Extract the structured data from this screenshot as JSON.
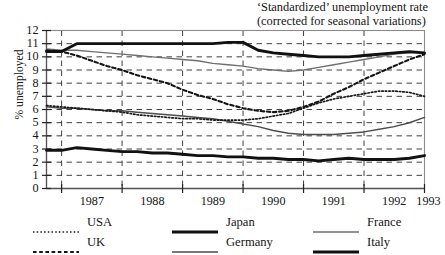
{
  "title": {
    "line1": "‘Standardized’ unemployment rate",
    "line2": "(corrected for seasonal variations)"
  },
  "axes": {
    "ylabel": "% unemployed",
    "yticks": [
      "12",
      "11",
      "10",
      "9",
      "8",
      "7",
      "6",
      "5",
      "4",
      "3",
      "2",
      "1",
      "0"
    ],
    "xticks": [
      "1987",
      "1988",
      "1989",
      "1990",
      "1991",
      "1992",
      "1993"
    ]
  },
  "legend": [
    {
      "name": "USA",
      "style": "dotted",
      "color": "#1a1a1a",
      "width": 1.6
    },
    {
      "name": "UK",
      "style": "dashed",
      "color": "#1a1a1a",
      "width": 2.1
    },
    {
      "name": "Japan",
      "style": "solid-thick",
      "color": "#111111",
      "width": 3.0
    },
    {
      "name": "Germany",
      "style": "solid-medium",
      "color": "#4d4d4d",
      "width": 1.5
    },
    {
      "name": "France",
      "style": "solid-thin",
      "color": "#6e6e6e",
      "width": 1.4
    },
    {
      "name": "Italy",
      "style": "solid-thick",
      "color": "#111111",
      "width": 2.9
    }
  ],
  "chart_data": {
    "type": "line",
    "title": "‘Standardized’ unemployment rate (corrected for seasonal variations)",
    "xlabel": "",
    "ylabel": "% unemployed",
    "xlim": [
      1986.75,
      1993.0
    ],
    "ylim": [
      0,
      12
    ],
    "grid": true,
    "legend_position": "below",
    "x": [
      1986.75,
      1987.0,
      1987.25,
      1987.5,
      1987.75,
      1988.0,
      1988.25,
      1988.5,
      1988.75,
      1989.0,
      1989.25,
      1989.5,
      1989.75,
      1990.0,
      1990.25,
      1990.5,
      1990.75,
      1991.0,
      1991.25,
      1991.5,
      1991.75,
      1992.0,
      1992.25,
      1992.5,
      1992.75,
      1993.0
    ],
    "series": [
      {
        "name": "Italy",
        "style": "solid-thick",
        "values": [
          10.4,
          10.4,
          11.0,
          11.0,
          11.0,
          11.0,
          11.0,
          11.0,
          11.0,
          11.0,
          11.0,
          11.0,
          11.1,
          11.1,
          10.5,
          10.3,
          10.2,
          10.1,
          10.0,
          10.0,
          10.0,
          10.1,
          10.2,
          10.3,
          10.4,
          10.3
        ]
      },
      {
        "name": "France",
        "style": "solid-thin",
        "values": [
          10.6,
          10.5,
          10.5,
          10.4,
          10.3,
          10.2,
          10.1,
          10.0,
          9.9,
          9.8,
          9.7,
          9.5,
          9.4,
          9.3,
          9.1,
          9.0,
          8.9,
          9.0,
          9.2,
          9.4,
          9.6,
          9.8,
          10.0,
          10.2,
          10.3,
          10.3
        ]
      },
      {
        "name": "UK",
        "style": "dashed",
        "values": [
          10.5,
          10.4,
          10.1,
          9.7,
          9.3,
          9.0,
          8.6,
          8.3,
          8.0,
          7.5,
          7.1,
          6.8,
          6.4,
          6.1,
          5.9,
          5.8,
          5.9,
          6.2,
          6.6,
          7.2,
          7.7,
          8.3,
          8.8,
          9.3,
          9.8,
          10.2
        ]
      },
      {
        "name": "USA",
        "style": "dotted",
        "values": [
          6.3,
          6.2,
          6.1,
          6.0,
          5.9,
          5.8,
          5.6,
          5.5,
          5.4,
          5.3,
          5.3,
          5.2,
          5.2,
          5.2,
          5.3,
          5.5,
          5.7,
          6.1,
          6.5,
          6.8,
          7.0,
          7.2,
          7.4,
          7.4,
          7.3,
          7.0
        ]
      },
      {
        "name": "Germany",
        "style": "solid-medium",
        "values": [
          6.2,
          6.1,
          6.1,
          6.0,
          5.9,
          5.9,
          5.8,
          5.7,
          5.6,
          5.5,
          5.4,
          5.3,
          5.1,
          4.9,
          4.7,
          4.4,
          4.2,
          4.1,
          4.1,
          4.1,
          4.2,
          4.3,
          4.5,
          4.7,
          5.0,
          5.4
        ]
      },
      {
        "name": "Japan",
        "style": "solid-thick",
        "values": [
          2.9,
          2.9,
          3.1,
          3.0,
          2.9,
          2.8,
          2.8,
          2.7,
          2.7,
          2.6,
          2.5,
          2.5,
          2.4,
          2.4,
          2.3,
          2.3,
          2.2,
          2.2,
          2.1,
          2.2,
          2.3,
          2.2,
          2.2,
          2.2,
          2.3,
          2.5
        ]
      }
    ]
  }
}
